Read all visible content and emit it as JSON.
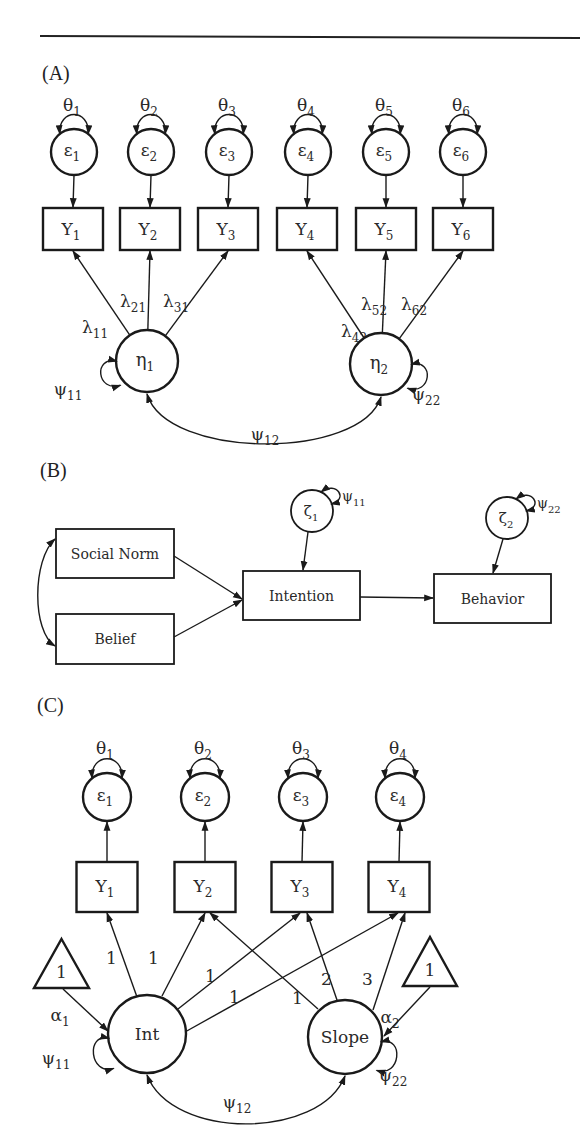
{
  "figure": {
    "rule": true,
    "panels": [
      {
        "id": "A",
        "label": "(A)",
        "description": "Two-factor confirmatory factor analysis model",
        "errors": [
          {
            "name": "ε",
            "sub": "1",
            "variance": "θ",
            "variance_sub": "1"
          },
          {
            "name": "ε",
            "sub": "2",
            "variance": "θ",
            "variance_sub": "2"
          },
          {
            "name": "ε",
            "sub": "3",
            "variance": "θ",
            "variance_sub": "3"
          },
          {
            "name": "ε",
            "sub": "4",
            "variance": "θ",
            "variance_sub": "4"
          },
          {
            "name": "ε",
            "sub": "5",
            "variance": "θ",
            "variance_sub": "5"
          },
          {
            "name": "ε",
            "sub": "6",
            "variance": "θ",
            "variance_sub": "6"
          }
        ],
        "indicators": [
          {
            "name": "Y",
            "sub": "1"
          },
          {
            "name": "Y",
            "sub": "2"
          },
          {
            "name": "Y",
            "sub": "3"
          },
          {
            "name": "Y",
            "sub": "4"
          },
          {
            "name": "Y",
            "sub": "5"
          },
          {
            "name": "Y",
            "sub": "6"
          }
        ],
        "loadings": [
          {
            "name": "λ",
            "sub": "11"
          },
          {
            "name": "λ",
            "sub": "21"
          },
          {
            "name": "λ",
            "sub": "31"
          },
          {
            "name": "λ",
            "sub": "42"
          },
          {
            "name": "λ",
            "sub": "52"
          },
          {
            "name": "λ",
            "sub": "62"
          }
        ],
        "factors": [
          {
            "name": "η",
            "sub": "1",
            "variance": "ψ",
            "variance_sub": "11"
          },
          {
            "name": "η",
            "sub": "2",
            "variance": "ψ",
            "variance_sub": "22"
          }
        ],
        "covariance": {
          "name": "ψ",
          "sub": "12"
        }
      },
      {
        "id": "B",
        "label": "(B)",
        "description": "Path model (theory of planned behavior style)",
        "exogenous": [
          "Social Norm",
          "Belief"
        ],
        "endogenous": [
          "Intention",
          "Behavior"
        ],
        "disturbances": [
          {
            "name": "ζ",
            "sub": "1",
            "variance": "ψ",
            "variance_sub": "11"
          },
          {
            "name": "ζ",
            "sub": "2",
            "variance": "ψ",
            "variance_sub": "22"
          }
        ]
      },
      {
        "id": "C",
        "label": "(C)",
        "description": "Linear latent growth curve model",
        "errors": [
          {
            "name": "ε",
            "sub": "1",
            "variance": "θ",
            "variance_sub": "1"
          },
          {
            "name": "ε",
            "sub": "2",
            "variance": "θ",
            "variance_sub": "2"
          },
          {
            "name": "ε",
            "sub": "3",
            "variance": "θ",
            "variance_sub": "3"
          },
          {
            "name": "ε",
            "sub": "4",
            "variance": "θ",
            "variance_sub": "4"
          }
        ],
        "indicators": [
          {
            "name": "Y",
            "sub": "1"
          },
          {
            "name": "Y",
            "sub": "2"
          },
          {
            "name": "Y",
            "sub": "3"
          },
          {
            "name": "Y",
            "sub": "4"
          }
        ],
        "intercept_loadings": [
          "1",
          "1",
          "1",
          "1"
        ],
        "slope_loadings": [
          "1",
          "2",
          "3"
        ],
        "factors": [
          {
            "name": "Int",
            "variance": "ψ",
            "variance_sub": "11",
            "mean": "α",
            "mean_sub": "1"
          },
          {
            "name": "Slope",
            "variance": "ψ",
            "variance_sub": "22",
            "mean": "α",
            "mean_sub": "2"
          }
        ],
        "constants": [
          "1",
          "1"
        ],
        "covariance": {
          "name": "ψ",
          "sub": "12"
        }
      }
    ]
  }
}
